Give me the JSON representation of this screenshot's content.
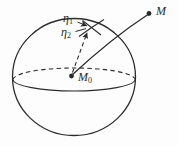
{
  "figure": {
    "ink_color": "#2b2b2b",
    "paper_color": "#fdfdfd",
    "labels": {
      "eta1": {
        "base": "η",
        "sub": "1"
      },
      "eta2": {
        "base": "η",
        "sub": "2"
      },
      "m0": {
        "base": "M",
        "sub": "0"
      },
      "m": {
        "base": "M"
      }
    }
  }
}
